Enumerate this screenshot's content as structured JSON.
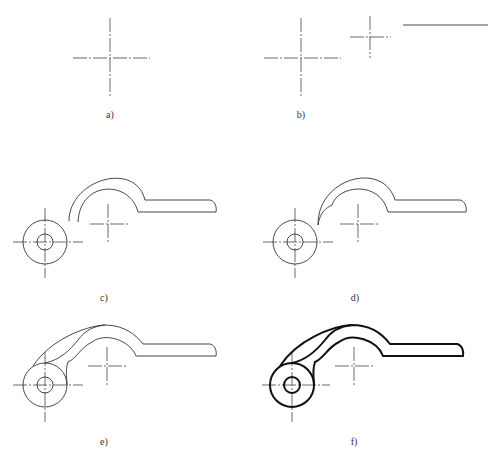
{
  "figure": {
    "panels": [
      {
        "id": "a",
        "label": "a)",
        "description": "Draw main centerlines"
      },
      {
        "id": "b",
        "label": "b)",
        "description": "Locate secondary center and reference line"
      },
      {
        "id": "c",
        "label": "c)",
        "description": "Draw circles, hook arc and handle"
      },
      {
        "id": "d",
        "label": "d)",
        "description": "Draw connecting arc to circle"
      },
      {
        "id": "e",
        "label": "e)",
        "description": "Draw outer tangent curves"
      },
      {
        "id": "f",
        "label": "f)",
        "description": "Thicken visible outline"
      }
    ]
  }
}
